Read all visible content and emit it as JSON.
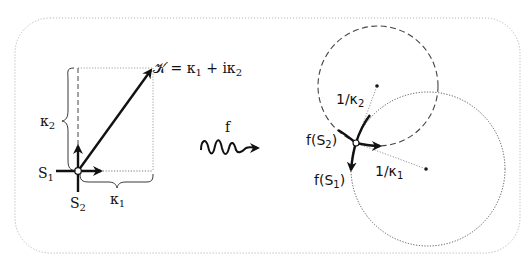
{
  "diagram": {
    "frame": {
      "style": "dotted rounded rectangle",
      "color": "#b0b0b0"
    },
    "left_panel": {
      "vector_label": "𝒦 = κ₁ + iκ₂",
      "vector_label_parts": {
        "K": "𝒦",
        "eq": " = κ",
        "s1": "1",
        "plus": " + iκ",
        "s2": "2"
      },
      "brace_vertical_label": {
        "base": "κ",
        "sub": "2"
      },
      "brace_horizontal_label": {
        "base": "κ",
        "sub": "1"
      },
      "axis_label_x": {
        "base": "S",
        "sub": "1"
      },
      "axis_label_y": {
        "base": "S",
        "sub": "2"
      }
    },
    "map_arrow": {
      "label": "f"
    },
    "right_panel": {
      "image_label_s2": {
        "pre": "f(S",
        "sub": "2",
        "post": ")"
      },
      "image_label_s1": {
        "pre": "f(S",
        "sub": "1",
        "post": ")"
      },
      "radius_label_2": {
        "pre": "1/κ",
        "sub": "2"
      },
      "radius_label_1": {
        "pre": "1/κ",
        "sub": "1"
      },
      "dashed_circle": {
        "role": "osculating circle radius 1/κ2",
        "style": "dashed"
      },
      "dotted_circle": {
        "role": "osculating circle radius 1/κ1",
        "style": "dotted"
      }
    },
    "colors": {
      "ink": "#111111",
      "guide": "#777777",
      "frame": "#b8b8b8"
    }
  }
}
